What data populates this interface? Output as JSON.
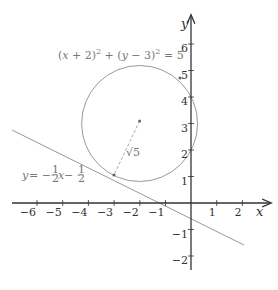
{
  "diagram": {
    "title": "",
    "axes": {
      "x_label": "x",
      "y_label": "y",
      "x_ticks": [
        "−6",
        "−5",
        "−4",
        "−3",
        "−2",
        "−1",
        "1",
        "2"
      ],
      "y_ticks": [
        "6",
        "5",
        "4",
        "3",
        "2",
        "1",
        "−1",
        "−2"
      ]
    },
    "circle": {
      "equation_parts": {
        "p1": "(",
        "x": "x",
        "p2": " + 2)",
        "sup1": "2",
        "p3": " + (",
        "y": "y",
        "p4": " − 3)",
        "sup2": "2",
        "p5": " = 5"
      },
      "center": [
        -2,
        3
      ],
      "radius_label": "√5"
    },
    "line": {
      "equation_parts": {
        "y": "y",
        "eq": " = −",
        "frac_num": "1",
        "frac_den": "2",
        "x": "x",
        "minus": " − ",
        "frac2_num": "1",
        "frac2_den": "2"
      },
      "tangent_point": [
        -3,
        1
      ]
    },
    "colors": {
      "axis": "#333333",
      "circle": "#999999",
      "line": "#999999",
      "radius": "#aaaaaa",
      "label": "#777777"
    }
  }
}
